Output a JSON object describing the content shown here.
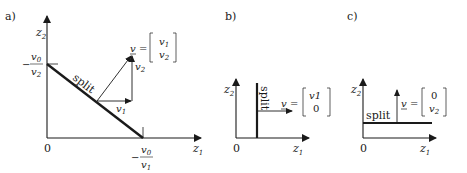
{
  "panels": [
    {
      "label": "a)",
      "axes": {
        "x": "z",
        "x_sub": "1",
        "y": "z",
        "y_sub": "2",
        "origin": "0"
      },
      "y_intercept": {
        "sign": "−",
        "num": "v",
        "num_sub": "0",
        "den": "v",
        "den_sub": "2"
      },
      "x_intercept": {
        "sign": "−",
        "num": "v",
        "num_sub": "0",
        "den": "v",
        "den_sub": "1"
      },
      "split_label": "split",
      "component_labels": {
        "v1": "v",
        "v1_sub": "1",
        "v2": "v",
        "v2_sub": "2"
      },
      "vector": {
        "name": "v",
        "eq": "=",
        "row1": "v",
        "row1_sub": "1",
        "row2": "v",
        "row2_sub": "2"
      }
    },
    {
      "label": "b)",
      "axes": {
        "x": "z",
        "x_sub": "1",
        "y": "z",
        "y_sub": "2",
        "origin": "0"
      },
      "split_label": "split",
      "vector": {
        "name": "v",
        "eq": "=",
        "row1": "v1",
        "row2": "0"
      }
    },
    {
      "label": "c)",
      "axes": {
        "x": "z",
        "x_sub": "1",
        "y": "z",
        "y_sub": "2",
        "origin": "0"
      },
      "split_label": "split",
      "vector": {
        "name": "v",
        "eq": "=",
        "row1": "0",
        "row2": "v",
        "row2_sub": "2"
      }
    }
  ],
  "colors": {
    "ink": "#1a1a1a",
    "background": "#ffffff"
  }
}
